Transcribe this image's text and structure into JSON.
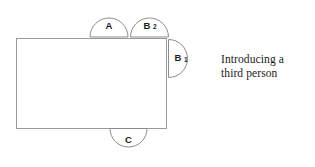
{
  "diagram": {
    "title": "Introducing a third person",
    "background_color": "#ffffff",
    "stroke_color": "#8c8c8c",
    "table": {
      "name": "table",
      "shape": "rectangle",
      "x": 16,
      "y": 38,
      "width": 151,
      "height": 91
    },
    "seats": [
      {
        "id": "seat-a",
        "label": "A",
        "subscript": "",
        "position": "top",
        "orientation": "up",
        "cx": 109,
        "cy": 37,
        "radius": 19
      },
      {
        "id": "seat-b2",
        "label": "B",
        "subscript": "2",
        "position": "top-right",
        "orientation": "up",
        "cx": 149.5,
        "cy": 37,
        "radius": 19
      },
      {
        "id": "seat-b1",
        "label": "B",
        "subscript": "1",
        "position": "right",
        "orientation": "right",
        "cx": 169,
        "cy": 58.5,
        "radius": 19
      },
      {
        "id": "seat-c",
        "label": "C",
        "subscript": "",
        "position": "bottom",
        "orientation": "down",
        "cx": 128.5,
        "cy": 129,
        "radius": 18.5
      }
    ]
  },
  "caption": {
    "line1": "Introducing a",
    "line2": "third person",
    "text": "Introducing a\nthird person"
  }
}
